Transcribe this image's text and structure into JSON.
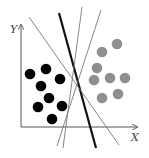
{
  "diagram": {
    "type": "svm-separating-hyperplanes",
    "axes": {
      "x_label": "X",
      "y_label": "Y",
      "origin": [
        21,
        127
      ],
      "x_end": [
        137,
        127
      ],
      "y_end": [
        21,
        25
      ],
      "color": "#555555"
    },
    "class_a": {
      "color": "#000000",
      "radius": 5.3,
      "points": [
        [
          30,
          74
        ],
        [
          46,
          69
        ],
        [
          60,
          79
        ],
        [
          41,
          86
        ],
        [
          49,
          98
        ],
        [
          38,
          107
        ],
        [
          62,
          106
        ],
        [
          52,
          119
        ]
      ]
    },
    "class_b": {
      "color": "#8f8f8f",
      "radius": 5.3,
      "points": [
        [
          117,
          44
        ],
        [
          102,
          52
        ],
        [
          97,
          68
        ],
        [
          94,
          80
        ],
        [
          110,
          78
        ],
        [
          125,
          78
        ],
        [
          102,
          98
        ],
        [
          118,
          94
        ]
      ]
    },
    "lines": [
      {
        "id": "optimal",
        "from": [
          59,
          13
        ],
        "to": [
          96,
          148
        ],
        "color": "#111111",
        "width": 2.2
      },
      {
        "id": "thin-1",
        "from": [
          29,
          17
        ],
        "to": [
          119,
          145
        ],
        "color": "#777777",
        "width": 0.9
      },
      {
        "id": "thin-2",
        "from": [
          82,
          7
        ],
        "to": [
          63,
          148
        ],
        "color": "#777777",
        "width": 0.9
      },
      {
        "id": "thin-3",
        "from": [
          101,
          10
        ],
        "to": [
          57,
          146
        ],
        "color": "#777777",
        "width": 0.9
      }
    ]
  }
}
